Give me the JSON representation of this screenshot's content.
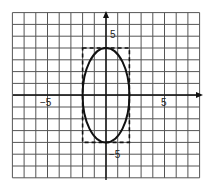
{
  "figure": {
    "type": "ellipse-on-grid",
    "x_range": [
      -8,
      8
    ],
    "y_range": [
      -7,
      7
    ],
    "grid_step": 1,
    "axes": {
      "x_arrow": true,
      "y_arrow": true
    },
    "tick_labels": {
      "x_neg": "−5",
      "x_pos": "5",
      "y_pos": "5",
      "y_neg": "−5"
    },
    "ellipse": {
      "center": [
        0,
        0
      ],
      "semi_axis_x": 2,
      "semi_axis_y": 4,
      "equation": "x²/4 + y²/16 = 1"
    },
    "bounding_box": {
      "x": [
        -2,
        2
      ],
      "y": [
        -4,
        4
      ],
      "style": "dashed"
    },
    "colors": {
      "grid": "#555555",
      "axis": "#111111",
      "curve": "#111111",
      "background": "#ffffff"
    }
  }
}
